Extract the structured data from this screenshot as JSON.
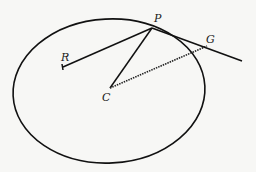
{
  "diagram": {
    "type": "geometry",
    "colors": {
      "stroke": "#111111",
      "background": "#f7f7f5"
    },
    "ellipse": {
      "cx": 109,
      "cy": 91,
      "rx": 96,
      "ry": 72
    },
    "points": {
      "P": {
        "label": "P",
        "x": 152,
        "y": 28
      },
      "R": {
        "label": "R",
        "x": 63,
        "y": 67
      },
      "C": {
        "label": "C",
        "x": 110,
        "y": 88
      },
      "G": {
        "label": "G",
        "x": 207,
        "y": 46
      }
    },
    "lines": [
      {
        "from": "P",
        "to": "R",
        "style": "solid"
      },
      {
        "from": "P",
        "to": "C",
        "style": "solid"
      },
      {
        "from": "C",
        "to": "G",
        "style": "dashed"
      },
      {
        "from": "P",
        "to": "tangent-end",
        "style": "solid"
      }
    ]
  }
}
